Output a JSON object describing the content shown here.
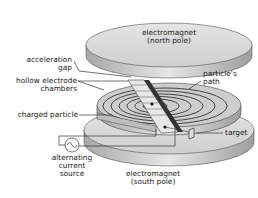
{
  "diagram": {
    "labels": {
      "top_magnet_line1": "electromagnet",
      "top_magnet_line2": "(north pole)",
      "acceleration_gap_line1": "acceleration",
      "acceleration_gap_line2": "gap",
      "hollow_electrode_line1": "hollow electrode",
      "hollow_electrode_line2": "chambers",
      "particles_path_line1": "particle's",
      "particles_path_line2": "path",
      "charged_particle": "charged particle",
      "target": "target",
      "ac_source_line1": "alternating",
      "ac_source_line2": "current",
      "ac_source_line3": "source",
      "bottom_magnet_line1": "electromagnet",
      "bottom_magnet_line2": "(south pole)"
    },
    "colors": {
      "magnet_top": "#d9d9d9",
      "magnet_side": "#bdbdbd",
      "dee": "#c8c8c8",
      "lines": "#333333"
    }
  }
}
